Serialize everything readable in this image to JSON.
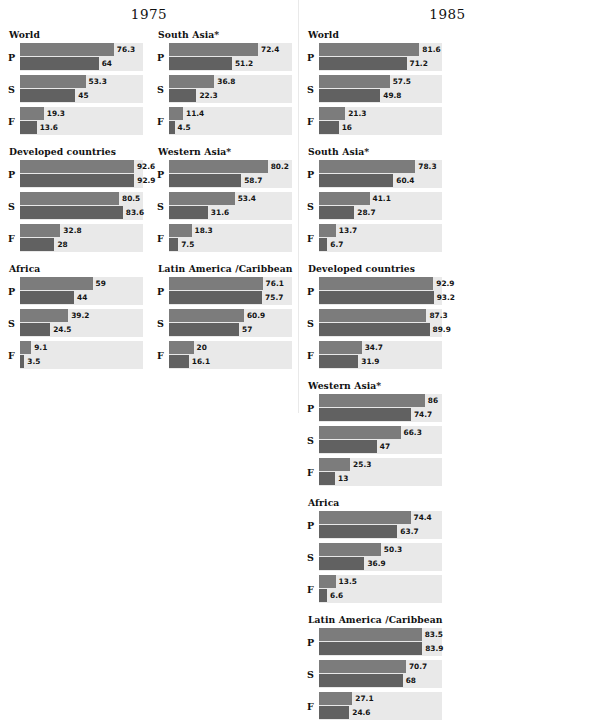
{
  "chart_data": {
    "type": "bar",
    "orientation": "horizontal",
    "xlabel": "",
    "ylabel": "",
    "xlim": [
      0,
      100
    ],
    "grid": false,
    "legend_position": "none",
    "series": [
      {
        "name": "top-bar",
        "color": "#7c7c7c"
      },
      {
        "name": "bottom-bar",
        "color": "#616161"
      }
    ],
    "level_codes": [
      "P",
      "S",
      "F"
    ],
    "panels": [
      {
        "year": "1975",
        "groups": [
          {
            "name": "World",
            "rows": [
              {
                "code": "P",
                "top": 76.3,
                "bottom": 64,
                "top_label": "76.3",
                "bottom_label": "64"
              },
              {
                "code": "S",
                "top": 53.3,
                "bottom": 45,
                "top_label": "53.3",
                "bottom_label": "45"
              },
              {
                "code": "F",
                "top": 19.3,
                "bottom": 13.6,
                "top_label": "19.3",
                "bottom_label": "13.6"
              }
            ]
          },
          {
            "name": "South Asia*",
            "rows": [
              {
                "code": "P",
                "top": 72.4,
                "bottom": 51.2,
                "top_label": "72.4",
                "bottom_label": "51.2"
              },
              {
                "code": "S",
                "top": 36.8,
                "bottom": 22.3,
                "top_label": "36.8",
                "bottom_label": "22.3"
              },
              {
                "code": "F",
                "top": 11.4,
                "bottom": 4.5,
                "top_label": "11.4",
                "bottom_label": "4.5"
              }
            ]
          },
          {
            "name": "Developed countries",
            "rows": [
              {
                "code": "P",
                "top": 92.6,
                "bottom": 92.9,
                "top_label": "92.6",
                "bottom_label": "92.9"
              },
              {
                "code": "S",
                "top": 80.5,
                "bottom": 83.6,
                "top_label": "80.5",
                "bottom_label": "83.6"
              },
              {
                "code": "F",
                "top": 32.8,
                "bottom": 28,
                "top_label": "32.8",
                "bottom_label": "28"
              }
            ]
          },
          {
            "name": "Western Asia*",
            "rows": [
              {
                "code": "P",
                "top": 80.2,
                "bottom": 58.7,
                "top_label": "80.2",
                "bottom_label": "58.7"
              },
              {
                "code": "S",
                "top": 53.4,
                "bottom": 31.6,
                "top_label": "53.4",
                "bottom_label": "31.6"
              },
              {
                "code": "F",
                "top": 18.3,
                "bottom": 7.5,
                "top_label": "18.3",
                "bottom_label": "7.5"
              }
            ]
          },
          {
            "name": "Africa",
            "rows": [
              {
                "code": "P",
                "top": 59,
                "bottom": 44,
                "top_label": "59",
                "bottom_label": "44"
              },
              {
                "code": "S",
                "top": 39.2,
                "bottom": 24.5,
                "top_label": "39.2",
                "bottom_label": "24.5"
              },
              {
                "code": "F",
                "top": 9.1,
                "bottom": 3.5,
                "top_label": "9.1",
                "bottom_label": "3.5"
              }
            ]
          },
          {
            "name": "Latin America /Caribbean",
            "rows": [
              {
                "code": "P",
                "top": 76.1,
                "bottom": 75.7,
                "top_label": "76.1",
                "bottom_label": "75.7"
              },
              {
                "code": "S",
                "top": 60.9,
                "bottom": 57,
                "top_label": "60.9",
                "bottom_label": "57"
              },
              {
                "code": "F",
                "top": 20,
                "bottom": 16.1,
                "top_label": "20",
                "bottom_label": "16.1"
              }
            ]
          }
        ]
      },
      {
        "year": "1985",
        "groups": [
          {
            "name": "World",
            "rows": [
              {
                "code": "P",
                "top": 81.6,
                "bottom": 71.2,
                "top_label": "81.6",
                "bottom_label": "71.2"
              },
              {
                "code": "S",
                "top": 57.5,
                "bottom": 49.8,
                "top_label": "57.5",
                "bottom_label": "49.8"
              },
              {
                "code": "F",
                "top": 21.3,
                "bottom": 16,
                "top_label": "21.3",
                "bottom_label": "16"
              }
            ]
          },
          {
            "name": "South Asia*",
            "rows": [
              {
                "code": "P",
                "top": 78.3,
                "bottom": 60.4,
                "top_label": "78.3",
                "bottom_label": "60.4"
              },
              {
                "code": "S",
                "top": 41.1,
                "bottom": 28.7,
                "top_label": "41.1",
                "bottom_label": "28.7"
              },
              {
                "code": "F",
                "top": 13.7,
                "bottom": 6.7,
                "top_label": "13.7",
                "bottom_label": "6.7"
              }
            ]
          },
          {
            "name": "Developed countries",
            "rows": [
              {
                "code": "P",
                "top": 92.9,
                "bottom": 93.2,
                "top_label": "92.9",
                "bottom_label": "93.2"
              },
              {
                "code": "S",
                "top": 87.3,
                "bottom": 89.9,
                "top_label": "87.3",
                "bottom_label": "89.9"
              },
              {
                "code": "F",
                "top": 34.7,
                "bottom": 31.9,
                "top_label": "34.7",
                "bottom_label": "31.9"
              }
            ]
          },
          {
            "name": "Western Asia*",
            "rows": [
              {
                "code": "P",
                "top": 86,
                "bottom": 74.7,
                "top_label": "86",
                "bottom_label": "74.7"
              },
              {
                "code": "S",
                "top": 66.3,
                "bottom": 47,
                "top_label": "66.3",
                "bottom_label": "47"
              },
              {
                "code": "F",
                "top": 25.3,
                "bottom": 13,
                "top_label": "25.3",
                "bottom_label": "13"
              }
            ]
          },
          {
            "name": "Africa",
            "rows": [
              {
                "code": "P",
                "top": 74.4,
                "bottom": 63.7,
                "top_label": "74.4",
                "bottom_label": "63.7"
              },
              {
                "code": "S",
                "top": 50.3,
                "bottom": 36.9,
                "top_label": "50.3",
                "bottom_label": "36.9"
              },
              {
                "code": "F",
                "top": 13.5,
                "bottom": 6.6,
                "top_label": "13.5",
                "bottom_label": "6.6"
              }
            ]
          },
          {
            "name": "Latin America /Caribbean",
            "rows": [
              {
                "code": "P",
                "top": 83.5,
                "bottom": 83.9,
                "top_label": "83.5",
                "bottom_label": "83.9"
              },
              {
                "code": "S",
                "top": 70.7,
                "bottom": 68,
                "top_label": "70.7",
                "bottom_label": "68"
              },
              {
                "code": "F",
                "top": 27.1,
                "bottom": 24.6,
                "top_label": "27.1",
                "bottom_label": "24.6"
              }
            ]
          }
        ]
      }
    ]
  },
  "colors": {
    "bar_top": "#7c7c7c",
    "bar_bottom": "#616161",
    "track": "#e9e9e9",
    "background": "#ffffff",
    "text": "#111111"
  }
}
